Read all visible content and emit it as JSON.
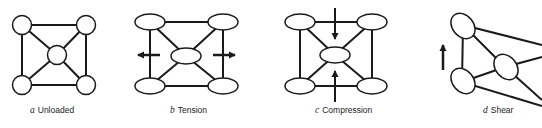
{
  "figure": {
    "panels": [
      {
        "id": "a",
        "letter": "a",
        "title": "Unloaded",
        "load": "none"
      },
      {
        "id": "b",
        "letter": "b",
        "title": "Tension",
        "load": "horizontal-outward"
      },
      {
        "id": "c",
        "letter": "c",
        "title": "Compression",
        "load": "vertical-inward"
      },
      {
        "id": "d",
        "letter": "d",
        "title": "Shear",
        "load": "vertical-upward-left"
      }
    ],
    "colors": {
      "stroke": "#1a1a1a",
      "fill": "#ffffff",
      "background": "#ffffff"
    }
  }
}
